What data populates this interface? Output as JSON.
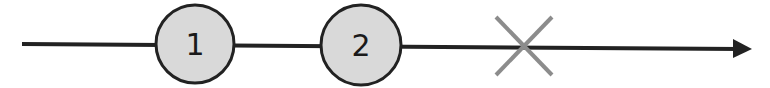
{
  "diagram": {
    "type": "marble-timeline",
    "line": {
      "x1": 22,
      "y1": 44,
      "x2": 738,
      "y2": 49,
      "color": "#222222"
    },
    "arrow": {
      "tip_x": 752,
      "tip_y": 49,
      "color": "#222222"
    },
    "nodes": [
      {
        "label": "1",
        "cx": 195,
        "cy": 44,
        "r": 39,
        "fill": "#d9d9d9",
        "stroke": "#222222"
      },
      {
        "label": "2",
        "cx": 361,
        "cy": 45,
        "r": 40,
        "fill": "#d9d9d9",
        "stroke": "#222222"
      }
    ],
    "error_marker": {
      "symbol": "X",
      "cx": 524,
      "cy": 46,
      "half_w": 28,
      "half_h": 29,
      "color": "#8c8c8c"
    }
  }
}
